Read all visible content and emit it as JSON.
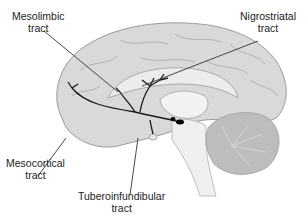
{
  "diagram": {
    "labels": [
      {
        "id": "mesolimbic",
        "line1": "Mesolimbic",
        "line2": "tract"
      },
      {
        "id": "nigrostriatal",
        "line1": "Nigrostriatal",
        "line2": "tract"
      },
      {
        "id": "mesocortical",
        "line1": "Mesocortical",
        "line2": "tract"
      },
      {
        "id": "tuberoinfundibular",
        "line1": "Tuberoinfundibular",
        "line2": "tract"
      }
    ],
    "colors": {
      "cortex": "#d9d9d9",
      "cortex_outline": "#9a9a9a",
      "inner": "#ececec",
      "cerebellum": "#bdbdbd",
      "tract": "#1a1a1a",
      "nucleus": "#000000"
    }
  }
}
